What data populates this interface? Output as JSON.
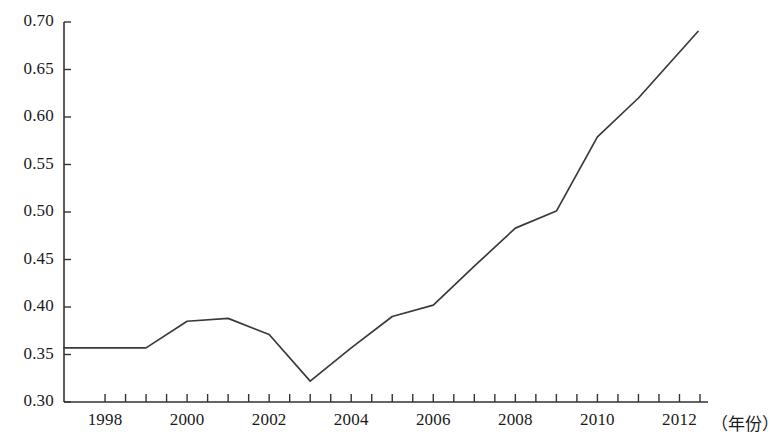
{
  "chart_data": {
    "type": "line",
    "title": "",
    "subtitle": "",
    "xlabel": "（年份）",
    "ylabel": "",
    "xlim": [
      1997,
      2012.5
    ],
    "ylim": [
      0.3,
      0.7
    ],
    "grid": false,
    "legend": null,
    "y_ticks": [
      "0.70",
      "0.65",
      "0.60",
      "0.55",
      "0.50",
      "0.45",
      "0.40",
      "0.35",
      "0.30"
    ],
    "y_tick_values": [
      0.7,
      0.65,
      0.6,
      0.55,
      0.5,
      0.45,
      0.4,
      0.35,
      0.3
    ],
    "x_ticks": [
      "1998",
      "2000",
      "2002",
      "2004",
      "2006",
      "2008",
      "2010",
      "2012"
    ],
    "x_tick_values": [
      1998,
      2000,
      2002,
      2004,
      2006,
      2008,
      2010,
      2012
    ],
    "x_minor_ticks": [
      1998,
      1999,
      2000,
      2001,
      2002,
      2003,
      2004,
      2005,
      2006,
      2007,
      2008,
      2009,
      2010,
      2011,
      2012
    ],
    "x": [
      1997,
      1998,
      1999,
      2000,
      2001,
      2002,
      2003,
      2004,
      2005,
      2006,
      2007,
      2008,
      2009,
      2010,
      2011,
      2012.45
    ],
    "values": [
      0.357,
      0.357,
      0.357,
      0.385,
      0.388,
      0.371,
      0.322,
      0.357,
      0.39,
      0.402,
      0.443,
      0.483,
      0.501,
      0.579,
      0.62,
      0.69
    ],
    "series": [
      {
        "name": "series-1",
        "color": "#3a3a3a",
        "values": [
          0.357,
          0.357,
          0.357,
          0.385,
          0.388,
          0.371,
          0.322,
          0.357,
          0.39,
          0.402,
          0.443,
          0.483,
          0.501,
          0.579,
          0.62,
          0.69
        ]
      }
    ],
    "annotations": []
  },
  "axes": {
    "unit_label": "（年份）"
  }
}
